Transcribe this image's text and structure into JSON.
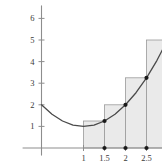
{
  "figure": {
    "title": "",
    "background_color": "#ffffff",
    "axis_color": "#8d8d8d",
    "curve_color": "#4a4a4a",
    "rect_fill": "#eaeaea",
    "rect_stroke": "#9a9a9a",
    "dot_color": "#1a1a1a",
    "label_color": "#3a3a3a"
  },
  "chart_data": {
    "type": "area",
    "title": "",
    "xlabel": "",
    "ylabel": "",
    "xlim": [
      -0.45,
      3.35
    ],
    "ylim": [
      -0.35,
      6.6
    ],
    "grid": false,
    "legend": null,
    "x_ticks": [
      1,
      1.5,
      2,
      2.5,
      3
    ],
    "x_tick_labels": [
      "1",
      "1.5",
      "2",
      "2.5",
      "3"
    ],
    "y_ticks": [
      1,
      2,
      3,
      4,
      5,
      6
    ],
    "y_tick_labels": [
      "1",
      "2",
      "3",
      "4",
      "5",
      "6"
    ],
    "series": [
      {
        "name": "curve",
        "type": "line",
        "x": [
          0,
          0.25,
          0.5,
          0.75,
          1,
          1.25,
          1.5,
          1.75,
          2,
          2.25,
          2.5,
          2.75,
          3,
          3.25
        ],
        "y": [
          2.0,
          1.56,
          1.25,
          1.06,
          1.0,
          1.06,
          1.25,
          1.56,
          2.0,
          2.56,
          3.25,
          4.06,
          5.0,
          6.06
        ]
      },
      {
        "name": "right-endpoint rectangles",
        "type": "bar",
        "bar_left_edges": [
          1,
          1.5,
          2,
          2.5
        ],
        "bar_right_edges": [
          1.5,
          2,
          2.5,
          3
        ],
        "bar_width": 0.5,
        "values": [
          1.25,
          2.0,
          3.25,
          5.0
        ]
      },
      {
        "name": "sample points",
        "type": "scatter",
        "x": [
          1.5,
          2,
          2.5,
          3
        ],
        "y": [
          1.25,
          2.0,
          3.25,
          5.0
        ]
      },
      {
        "name": "axis points",
        "type": "scatter",
        "x": [
          1.5,
          2,
          2.5,
          3
        ],
        "y": [
          0,
          0,
          0,
          0
        ]
      }
    ]
  }
}
